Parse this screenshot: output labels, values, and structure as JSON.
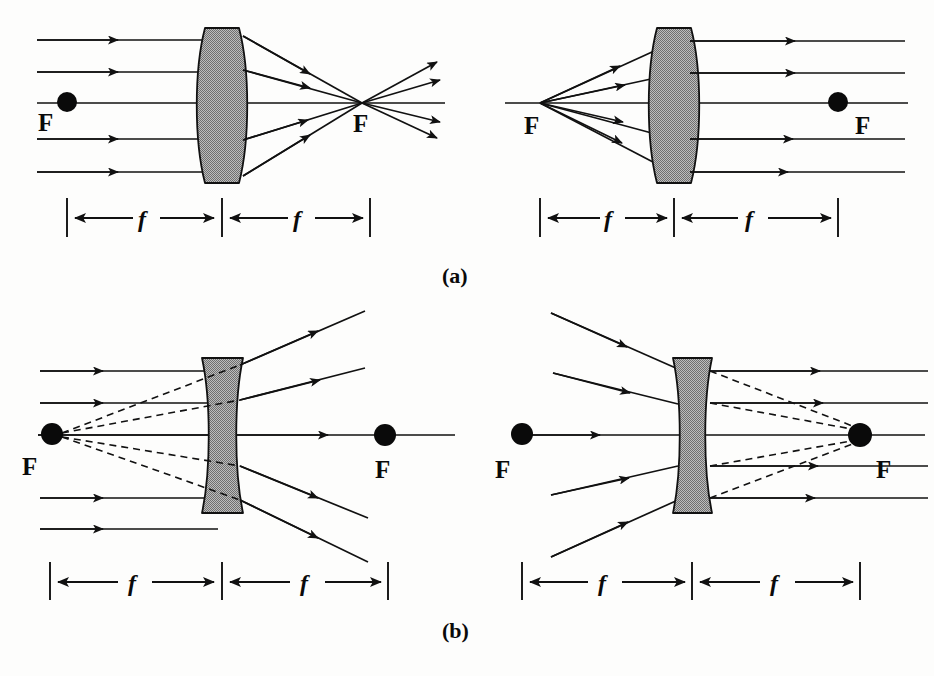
{
  "figure": {
    "background_color": "#fdfdfc",
    "ink_color": "#111111",
    "lens_fill_color": "#9d9d9d",
    "panels": [
      {
        "id": "a",
        "caption": "(a)",
        "lens_type": "converging",
        "lens_shape": "biconvex",
        "subpanels": [
          {
            "id": "a-left",
            "description": "Parallel rays entering a converging lens meet at the far focal point",
            "focal_marker_side": "left",
            "focal_dot_label": "F",
            "focus_point_label": "F",
            "ray_count": 5,
            "dimension_labels": [
              "f",
              "f"
            ]
          },
          {
            "id": "a-right",
            "description": "Rays from the near focal point leave a converging lens parallel",
            "focal_marker_side": "right",
            "focal_dot_label": "F",
            "focus_point_label": "F",
            "ray_count": 5,
            "dimension_labels": [
              "f",
              "f"
            ]
          }
        ]
      },
      {
        "id": "b",
        "caption": "(b)",
        "lens_type": "diverging",
        "lens_shape": "biconcave",
        "subpanels": [
          {
            "id": "b-left",
            "description": "Parallel rays diverge from a diverging lens, appearing to come from the near focal point",
            "focal_marker_side": "left",
            "focal_dot_label": "F",
            "focus_point_label": "F",
            "ray_count": 5,
            "virtual_rays": "dashed",
            "dimension_labels": [
              "f",
              "f"
            ]
          },
          {
            "id": "b-right",
            "description": "Converging rays aimed at the far focal point leave a diverging lens parallel",
            "focal_marker_side": "right",
            "focal_dot_label": "F",
            "focus_point_label": "F",
            "ray_count": 5,
            "virtual_rays": "dashed",
            "dimension_labels": [
              "f",
              "f"
            ]
          }
        ]
      }
    ]
  },
  "labels": {
    "focal_point": "F",
    "focal_length": "f",
    "panel_a": "(a)",
    "panel_b": "(b)"
  }
}
